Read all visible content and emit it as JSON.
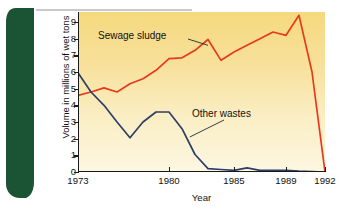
{
  "figure": {
    "tab_label": "figure 24-13",
    "tab_color": "#1a5434"
  },
  "chart_data": {
    "type": "line",
    "title": "",
    "xlabel": "Year",
    "ylabel": "Volume in millions of wet tons",
    "xlim": [
      1973,
      1992
    ],
    "ylim": [
      0,
      9.6
    ],
    "grid": false,
    "legend_position": "inline-annotations",
    "x_tick_labels": [
      "1973",
      "1980",
      "1985",
      "1989",
      "1992"
    ],
    "x_tick_values": [
      1973,
      1980,
      1985,
      1989,
      1992
    ],
    "y_tick_labels": [
      "0",
      "1",
      "2",
      "3",
      "4",
      "5",
      "6",
      "7",
      "8",
      "9"
    ],
    "y_tick_values": [
      0,
      1,
      2,
      3,
      4,
      5,
      6,
      7,
      8,
      9
    ],
    "x": [
      1973,
      1974,
      1975,
      1976,
      1977,
      1978,
      1979,
      1980,
      1981,
      1982,
      1983,
      1984,
      1985,
      1986,
      1987,
      1988,
      1989,
      1990,
      1991,
      1992
    ],
    "series": [
      {
        "name": "Sewage sludge",
        "color": "#e8391c",
        "values": [
          4.6,
          4.8,
          5.05,
          4.8,
          5.3,
          5.6,
          6.1,
          6.8,
          6.85,
          7.3,
          7.95,
          6.7,
          7.2,
          7.6,
          8.0,
          8.4,
          8.2,
          9.4,
          6.0,
          0.0
        ]
      },
      {
        "name": "Other wastes",
        "color": "#2d3f66",
        "values": [
          5.95,
          4.8,
          4.0,
          3.0,
          2.05,
          3.0,
          3.6,
          3.6,
          2.6,
          1.05,
          0.2,
          0.15,
          0.1,
          0.25,
          0.1,
          0.1,
          0.1,
          0.05,
          0.02,
          0.0
        ]
      }
    ],
    "annotations": [
      {
        "text": "Sewage sludge",
        "leader_to": [
          1983,
          7.6
        ]
      },
      {
        "text": "Other wastes",
        "leader_to": [
          1981.6,
          2.1
        ]
      }
    ]
  }
}
